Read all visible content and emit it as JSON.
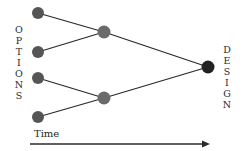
{
  "diagram": {
    "left_label": "OPTIONS",
    "right_label": "DESIGN",
    "axis_label": "Time",
    "colors": {
      "option_node": "#555555",
      "merge_node": "#6a6a6a",
      "design_node": "#222222",
      "edge": "#2a2a2a"
    },
    "nodes": [
      {
        "id": "option-1",
        "type": "option"
      },
      {
        "id": "option-2",
        "type": "option"
      },
      {
        "id": "option-3",
        "type": "option"
      },
      {
        "id": "option-4",
        "type": "option"
      },
      {
        "id": "merge-upper",
        "type": "merge"
      },
      {
        "id": "merge-lower",
        "type": "merge"
      },
      {
        "id": "design",
        "type": "design"
      }
    ],
    "edges": [
      {
        "from": "option-1",
        "to": "merge-upper"
      },
      {
        "from": "option-2",
        "to": "merge-upper"
      },
      {
        "from": "option-3",
        "to": "merge-lower"
      },
      {
        "from": "option-4",
        "to": "merge-lower"
      },
      {
        "from": "merge-upper",
        "to": "design"
      },
      {
        "from": "merge-lower",
        "to": "design"
      }
    ]
  }
}
